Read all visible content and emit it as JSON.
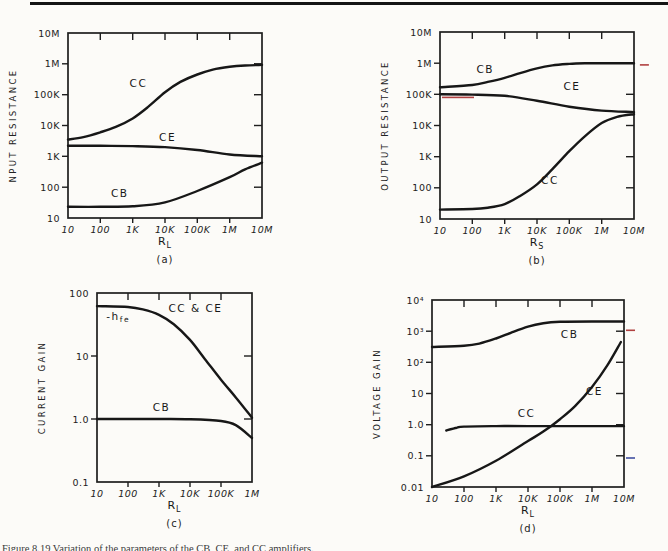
{
  "page": {
    "caption": "Figure 8.19   Variation of the parameters of the CB, CE, and CC amplifiers."
  },
  "colors": {
    "ink": "#171717",
    "red_pen": "#b04040",
    "blue_pen": "#4050a0"
  },
  "chart_data": [
    {
      "id": "a",
      "type": "line",
      "y_title": "NPUT RESISTANCE",
      "x_title": {
        "main": "R",
        "sub": "L"
      },
      "subfig": "(a)",
      "x_log_range": [
        1,
        7
      ],
      "y_log_range": [
        1,
        7
      ],
      "x_ticks": [
        {
          "v": 10,
          "label": "10"
        },
        {
          "v": 100,
          "label": "100"
        },
        {
          "v": 1000,
          "label": "1K"
        },
        {
          "v": 10000,
          "label": "10K"
        },
        {
          "v": 100000,
          "label": "100K"
        },
        {
          "v": 1000000,
          "label": "1M"
        },
        {
          "v": 10000000,
          "label": "10M"
        }
      ],
      "y_ticks": [
        {
          "v": 10000000,
          "label": "10M"
        },
        {
          "v": 1000000,
          "label": "1M"
        },
        {
          "v": 100000,
          "label": "100K"
        },
        {
          "v": 10000,
          "label": "10K"
        },
        {
          "v": 1000,
          "label": "1K"
        },
        {
          "v": 100,
          "label": "100"
        },
        {
          "v": 10,
          "label": "10"
        }
      ],
      "series": [
        {
          "name": "CC",
          "points": [
            [
              10,
              3500
            ],
            [
              30,
              4200
            ],
            [
              100,
              6000
            ],
            [
              300,
              9000
            ],
            [
              1000,
              17000
            ],
            [
              3000,
              40000
            ],
            [
              10000,
              120000
            ],
            [
              30000,
              260000
            ],
            [
              100000,
              450000
            ],
            [
              300000,
              650000
            ],
            [
              1000000,
              800000
            ],
            [
              3000000,
              880000
            ],
            [
              10000000,
              920000
            ]
          ]
        },
        {
          "name": "CE",
          "points": [
            [
              10,
              2200
            ],
            [
              100,
              2200
            ],
            [
              1000,
              2150
            ],
            [
              10000,
              2000
            ],
            [
              100000,
              1600
            ],
            [
              1000000,
              1150
            ],
            [
              10000000,
              1000
            ]
          ]
        },
        {
          "name": "CB",
          "points": [
            [
              10,
              23
            ],
            [
              100,
              23
            ],
            [
              1000,
              24
            ],
            [
              10000,
              32
            ],
            [
              100000,
              75
            ],
            [
              1000000,
              210
            ],
            [
              3000000,
              380
            ],
            [
              10000000,
              620
            ]
          ]
        }
      ],
      "labels": [
        {
          "text": "CC",
          "x": 1500,
          "y": 180000
        },
        {
          "text": "CE",
          "x": 12000,
          "y": 3200
        },
        {
          "text": "CB",
          "x": 400,
          "y": 48
        }
      ],
      "marks": []
    },
    {
      "id": "b",
      "type": "line",
      "y_title": "OUTPUT RESISTANCE",
      "x_title": {
        "main": "R",
        "sub": "S"
      },
      "subfig": "(b)",
      "x_log_range": [
        1,
        7
      ],
      "y_log_range": [
        1,
        7
      ],
      "x_ticks": [
        {
          "v": 10,
          "label": "10"
        },
        {
          "v": 100,
          "label": "100"
        },
        {
          "v": 1000,
          "label": "1K"
        },
        {
          "v": 10000,
          "label": "10K"
        },
        {
          "v": 100000,
          "label": "100K"
        },
        {
          "v": 1000000,
          "label": "1M"
        },
        {
          "v": 10000000,
          "label": "10M"
        }
      ],
      "y_ticks": [
        {
          "v": 10000000,
          "label": "10M"
        },
        {
          "v": 1000000,
          "label": "1M"
        },
        {
          "v": 100000,
          "label": "100K"
        },
        {
          "v": 10000,
          "label": "10K"
        },
        {
          "v": 1000,
          "label": "1K"
        },
        {
          "v": 100,
          "label": "100"
        },
        {
          "v": 10,
          "label": "10"
        }
      ],
      "series": [
        {
          "name": "CB",
          "points": [
            [
              10,
              170000
            ],
            [
              100,
              200000
            ],
            [
              300,
              250000
            ],
            [
              1000,
              340000
            ],
            [
              3000,
              480000
            ],
            [
              10000,
              680000
            ],
            [
              30000,
              850000
            ],
            [
              100000,
              950000
            ],
            [
              300000,
              990000
            ],
            [
              1000000,
              1000000
            ],
            [
              10000000,
              1000000
            ]
          ]
        },
        {
          "name": "CE",
          "points": [
            [
              10,
              100000
            ],
            [
              100,
              98000
            ],
            [
              1000,
              90000
            ],
            [
              10000,
              62000
            ],
            [
              100000,
              40000
            ],
            [
              1000000,
              30000
            ],
            [
              10000000,
              27000
            ]
          ]
        },
        {
          "name": "CC",
          "points": [
            [
              10,
              20
            ],
            [
              100,
              21
            ],
            [
              300,
              23
            ],
            [
              1000,
              30
            ],
            [
              3000,
              55
            ],
            [
              10000,
              130
            ],
            [
              30000,
              400
            ],
            [
              100000,
              1500
            ],
            [
              300000,
              4500
            ],
            [
              1000000,
              12000
            ],
            [
              3000000,
              19000
            ],
            [
              10000000,
              23000
            ]
          ]
        }
      ],
      "labels": [
        {
          "text": "CB",
          "x": 250,
          "y": 480000
        },
        {
          "text": "CE",
          "x": 120000,
          "y": 140000
        },
        {
          "text": "CC",
          "x": 25000,
          "y": 130
        }
      ],
      "marks": [
        {
          "x": 36,
          "y": 80000,
          "len": 32,
          "color": "#b04040"
        },
        {
          "x": 21000000,
          "y": 880000,
          "len": 9,
          "color": "#b04040"
        }
      ]
    },
    {
      "id": "c",
      "type": "line",
      "y_title": "CURRENT GAIN",
      "x_title": {
        "main": "R",
        "sub": "L"
      },
      "subfig": "(c)",
      "x_log_range": [
        1,
        6
      ],
      "y_log_range": [
        -1,
        2
      ],
      "x_ticks": [
        {
          "v": 10,
          "label": "10"
        },
        {
          "v": 100,
          "label": "100"
        },
        {
          "v": 1000,
          "label": "1K"
        },
        {
          "v": 10000,
          "label": "10K"
        },
        {
          "v": 100000,
          "label": "100K"
        },
        {
          "v": 1000000,
          "label": "1M"
        }
      ],
      "y_ticks": [
        {
          "v": 100,
          "label": "100"
        },
        {
          "v": 10,
          "label": "10"
        },
        {
          "v": 1,
          "label": "1.0"
        },
        {
          "v": 0.1,
          "label": "0.1"
        }
      ],
      "series": [
        {
          "name": "CC-CE",
          "points": [
            [
              10,
              62
            ],
            [
              100,
              60
            ],
            [
              300,
              55
            ],
            [
              1000,
              45
            ],
            [
              3000,
              32
            ],
            [
              10000,
              18
            ],
            [
              30000,
              9
            ],
            [
              100000,
              4.2
            ],
            [
              300000,
              2.2
            ],
            [
              1000000,
              1.05
            ]
          ]
        },
        {
          "name": "CB",
          "points": [
            [
              10,
              1.0
            ],
            [
              1000,
              1.0
            ],
            [
              10000,
              0.99
            ],
            [
              100000,
              0.93
            ],
            [
              300000,
              0.8
            ],
            [
              1000000,
              0.5
            ]
          ]
        }
      ],
      "labels": [
        {
          "text": "-h",
          "sub": "fe",
          "x": 20,
          "y": 38,
          "anchor": "start"
        },
        {
          "text": "CC & CE",
          "x": 15000,
          "y": 50
        },
        {
          "text": "CB",
          "x": 1200,
          "y": 1.35
        }
      ],
      "marks": []
    },
    {
      "id": "d",
      "type": "line",
      "y_title": "VOLTAGE GAIN",
      "x_title": {
        "main": "R",
        "sub": "L"
      },
      "subfig": "(d)",
      "x_log_range": [
        1,
        7
      ],
      "y_log_range": [
        -2,
        4
      ],
      "x_ticks": [
        {
          "v": 10,
          "label": "10"
        },
        {
          "v": 100,
          "label": "100"
        },
        {
          "v": 1000,
          "label": "1K"
        },
        {
          "v": 10000,
          "label": "10K"
        },
        {
          "v": 100000,
          "label": "100K"
        },
        {
          "v": 1000000,
          "label": "1M"
        },
        {
          "v": 10000000,
          "label": "10M"
        }
      ],
      "y_ticks": [
        {
          "v": 10000,
          "label": "10⁴"
        },
        {
          "v": 1000,
          "label": "10³"
        },
        {
          "v": 100,
          "label": "10²"
        },
        {
          "v": 10,
          "label": "10"
        },
        {
          "v": 1,
          "label": "1.0"
        },
        {
          "v": 0.1,
          "label": "0.1"
        },
        {
          "v": 0.01,
          "label": "0.01"
        }
      ],
      "series": [
        {
          "name": "CB",
          "points": [
            [
              10,
              310
            ],
            [
              100,
              340
            ],
            [
              300,
              400
            ],
            [
              1000,
              580
            ],
            [
              3000,
              900
            ],
            [
              10000,
              1400
            ],
            [
              30000,
              1800
            ],
            [
              100000,
              2000
            ],
            [
              1000000,
              2050
            ],
            [
              10000000,
              2050
            ]
          ]
        },
        {
          "name": "CE",
          "points": [
            [
              10,
              0.01
            ],
            [
              100,
              0.022
            ],
            [
              1000,
              0.07
            ],
            [
              10000,
              0.3
            ],
            [
              30000,
              0.6
            ],
            [
              100000,
              1.5
            ],
            [
              300000,
              4
            ],
            [
              1000000,
              16
            ],
            [
              3000000,
              80
            ],
            [
              8000000,
              450
            ]
          ]
        },
        {
          "name": "CC",
          "points": [
            [
              28,
              0.65
            ],
            [
              60,
              0.8
            ],
            [
              100,
              0.87
            ],
            [
              1000,
              0.9
            ],
            [
              10000,
              0.9
            ],
            [
              10000000,
              0.9
            ]
          ]
        }
      ],
      "labels": [
        {
          "text": "CB",
          "x": 200000,
          "y": 600
        },
        {
          "text": "CE",
          "x": 1200000,
          "y": 9
        },
        {
          "text": "CC",
          "x": 9000,
          "y": 1.8
        }
      ],
      "marks": [
        {
          "x": 16000000,
          "y": 1070,
          "len": 9,
          "color": "#b04040"
        },
        {
          "x": 16000000,
          "y": 0.085,
          "len": 9,
          "color": "#4050a0"
        }
      ]
    }
  ]
}
